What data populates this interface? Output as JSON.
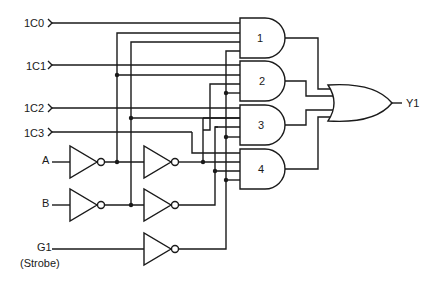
{
  "diagram": {
    "type": "logic-schematic",
    "inputs": {
      "data": [
        "1C0",
        "1C1",
        "1C2",
        "1C3"
      ],
      "select_a": "A",
      "select_b": "B",
      "strobe": "G1",
      "strobe_note": "(Strobe)"
    },
    "gates": {
      "and_labels": [
        "1",
        "2",
        "3",
        "4"
      ],
      "or_output": "Y1"
    },
    "colors": {
      "line": "#1a1a1a",
      "background": "#ffffff"
    }
  }
}
